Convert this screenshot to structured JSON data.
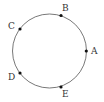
{
  "diagram": {
    "type": "circle-with-points",
    "circle": {
      "cx": 49.5,
      "cy": 51,
      "r": 37,
      "stroke": "#555555"
    },
    "point_color": "#111111",
    "points": [
      {
        "label": "A",
        "x": 86.3,
        "y": 51,
        "lx": 91,
        "ly": 54
      },
      {
        "label": "B",
        "x": 61,
        "y": 15.5,
        "lx": 62,
        "ly": 11
      },
      {
        "label": "C",
        "x": 20,
        "y": 29,
        "lx": 8,
        "ly": 29
      },
      {
        "label": "D",
        "x": 20,
        "y": 73,
        "lx": 8,
        "ly": 80
      },
      {
        "label": "E",
        "x": 61,
        "y": 87,
        "lx": 62,
        "ly": 97
      }
    ]
  }
}
